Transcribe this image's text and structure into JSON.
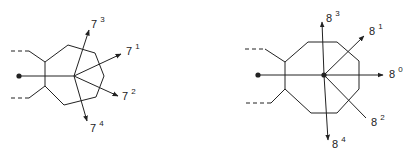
{
  "diagrams": {
    "left": {
      "shape": "heptagon",
      "labels": [
        {
          "id": "7_3",
          "base": "7",
          "exp": "3"
        },
        {
          "id": "7_1",
          "base": "7",
          "exp": "1"
        },
        {
          "id": "7_2",
          "base": "7",
          "exp": "2"
        },
        {
          "id": "7_4",
          "base": "7",
          "exp": "4"
        }
      ]
    },
    "right": {
      "shape": "octagon",
      "labels": [
        {
          "id": "8_3",
          "base": "8",
          "exp": "3"
        },
        {
          "id": "8_1",
          "base": "8",
          "exp": "1"
        },
        {
          "id": "8_0",
          "base": "8",
          "exp": "0"
        },
        {
          "id": "8_2",
          "base": "8",
          "exp": "2"
        },
        {
          "id": "8_4",
          "base": "8",
          "exp": "4"
        }
      ]
    }
  },
  "colors": {
    "stroke": "#222222",
    "background": "#ffffff"
  }
}
